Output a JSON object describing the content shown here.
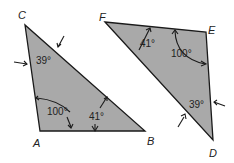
{
  "figure": {
    "fill_color": "#a9a9a9",
    "stroke_color": "#1a1a1a",
    "triangles": [
      {
        "name": "ABC",
        "vertices": {
          "A": "A",
          "B": "B",
          "C": "C"
        },
        "angles": {
          "C": "39°",
          "A": "100°",
          "B": "41°"
        }
      },
      {
        "name": "DEF",
        "vertices": {
          "D": "D",
          "E": "E",
          "F": "F"
        },
        "angles": {
          "F": "41°",
          "E": "100°",
          "D": "39°"
        }
      }
    ]
  }
}
